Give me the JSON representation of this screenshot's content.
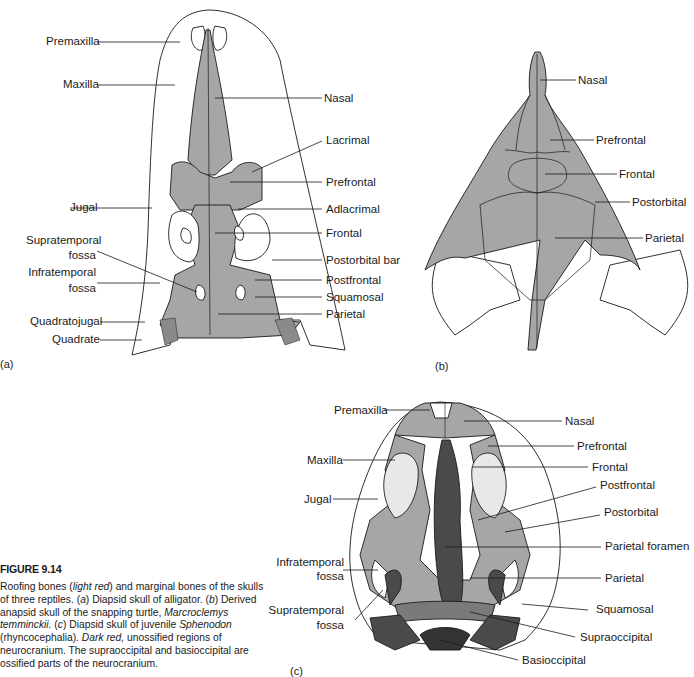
{
  "figure": {
    "number": "FIGURE 9.14",
    "caption_parts": {
      "p1": "Roofing bones (",
      "p2": "light red",
      "p3": ") and marginal bones of the skulls of three reptiles. (",
      "p4": "a",
      "p5": ") Diapsid skull of alligator. (",
      "p6": "b",
      "p7": ") Derived anapsid skull of the snapping turtle, ",
      "p8": "Marcroclemys temminckii.",
      "p9": " (",
      "p10": "c",
      "p11": ") Diapsid skull of juvenile ",
      "p12": "Sphenodon",
      "p13": " (rhyncocephalia). ",
      "p14": "Dark red,",
      "p15": " unossified regions of neurocranium. The supraoccipital and basioccipital are ossified parts of the neurocranium."
    }
  },
  "colors": {
    "roofing": "#a6a6a6",
    "dark_neurocranium": "#4a4a4a",
    "outline": "#1a1a1a",
    "marginal": "#ffffff"
  },
  "panels": {
    "a": {
      "tag": "(a)",
      "subject": "Diapsid skull of alligator",
      "labels_left": [
        "Premaxilla",
        "Maxilla",
        "Jugal",
        "Supratemporal",
        "fossa",
        "Infratemporal",
        "fossa",
        "Quadratojugal",
        "Quadrate"
      ],
      "labels_right": [
        "Nasal",
        "Lacrimal",
        "Prefrontal",
        "Adlacrimal",
        "Frontal",
        "Postorbital bar",
        "Postfrontal",
        "Squamosal",
        "Parietal"
      ]
    },
    "b": {
      "tag": "(b)",
      "subject": "Anapsid skull of snapping turtle",
      "labels_right": [
        "Nasal",
        "Prefrontal",
        "Frontal",
        "Postorbital",
        "Parietal"
      ]
    },
    "c": {
      "tag": "(c)",
      "subject": "Diapsid skull of juvenile Sphenodon",
      "labels_left": [
        "Premaxilla",
        "Maxilla",
        "Jugal",
        "Infratemporal",
        "fossa",
        "Supratemporal",
        "fossa"
      ],
      "labels_right": [
        "Nasal",
        "Prefrontal",
        "Frontal",
        "Postfrontal",
        "Postorbital",
        "Parietal foramen",
        "Parietal",
        "Squamosal",
        "Supraoccipital",
        "Basioccipital"
      ]
    }
  }
}
